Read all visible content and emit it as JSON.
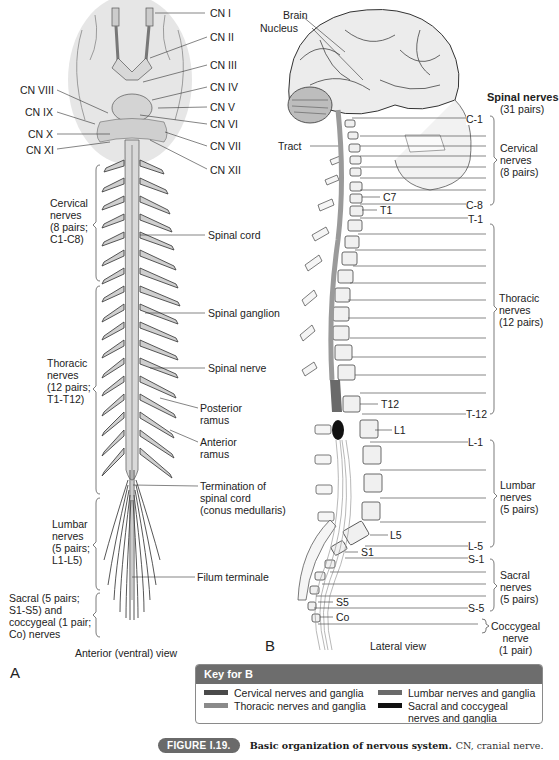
{
  "panel_a": {
    "letter": "A",
    "view_label": "Anterior (ventral) view",
    "cranial_nerves_right": [
      "CN I",
      "CN II",
      "CN III",
      "CN IV",
      "CN V",
      "CN VI",
      "CN VII",
      "CN XII"
    ],
    "cranial_nerves_left": [
      "CN VIII",
      "CN IX",
      "CN X",
      "CN XI"
    ],
    "left_groups": {
      "cervical": "Cervical\nnerves\n(8 pairs;\nC1-C8)",
      "thoracic": "Thoracic\nnerves\n(12 pairs;\nT1-T12)",
      "lumbar": "Lumbar\nnerves\n(5 pairs;\nL1-L5)",
      "sacral": "Sacral (5 pairs;\nS1-S5) and\ncoccygeal (1 pair;\nCo) nerves"
    },
    "right_labels": {
      "spinal_cord": "Spinal cord",
      "spinal_ganglion": "Spinal ganglion",
      "spinal_nerve": "Spinal nerve",
      "posterior_ramus": "Posterior\nramus",
      "anterior_ramus": "Anterior\nramus",
      "termination": "Termination of\nspinal cord\n(conus medullaris)",
      "filum": "Filum terminale"
    }
  },
  "panel_b": {
    "letter": "B",
    "view_label": "Lateral view",
    "brain": "Brain",
    "nucleus": "Nucleus",
    "tract": "Tract",
    "vertebra_labels": {
      "c7": "C7",
      "t1": "T1",
      "t12": "T12",
      "l1": "L1",
      "l5": "L5",
      "s1": "S1",
      "s5": "S5",
      "co": "Co"
    },
    "nerve_level_labels": {
      "c1": "C-1",
      "c8": "C-8",
      "t1": "T-1",
      "t12": "T-12",
      "l1": "L-1",
      "l5": "L-5",
      "s1": "S-1",
      "s5": "S-5"
    },
    "spinal_nerves_title": "Spinal nerves",
    "spinal_nerves_count": "(31 pairs)",
    "groups": {
      "cervical": "Cervical\nnerves\n(8 pairs)",
      "thoracic": "Thoracic\nnerves\n(12 pairs)",
      "lumbar": "Lumbar\nnerves\n(5 pairs)",
      "sacral": "Sacral\nnerves\n(5 pairs)",
      "coccygeal": "Coccygeal\nnerve\n(1 pair)"
    }
  },
  "key": {
    "title": "Key for B",
    "items": [
      {
        "label": "Cervical nerves and ganglia",
        "color": "#4a4a4a"
      },
      {
        "label": "Thoracic nerves and ganglia",
        "color": "#8a8a8a"
      },
      {
        "label": "Lumbar nerves and ganglia",
        "color": "#6a6a6a"
      },
      {
        "label": "Sacral and coccygeal\nnerves and ganglia",
        "color": "#111111"
      }
    ]
  },
  "caption": {
    "badge": "FIGURE I.19.",
    "bold": "Basic organization of nervous system.",
    "rest": "CN, cranial nerve."
  }
}
